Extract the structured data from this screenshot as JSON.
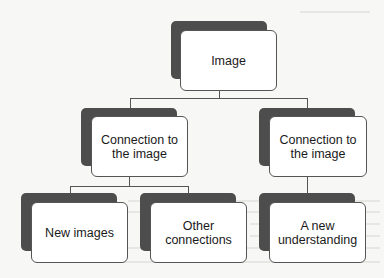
{
  "diagram": {
    "type": "hierarchy",
    "root": {
      "label": "Image"
    },
    "level2": [
      {
        "label": "Connection to the image",
        "line1": "Connection to",
        "line2": "the image"
      },
      {
        "label": "Connection to the image",
        "line1": "Connection to",
        "line2": "the image"
      }
    ],
    "level3": [
      {
        "label": "New images",
        "parent": 0
      },
      {
        "label": "Other connections",
        "line1": "Other",
        "line2": "connections",
        "parent": 0
      },
      {
        "label": "A new understanding",
        "line1": "A new",
        "line2": "understanding",
        "parent": 1
      }
    ],
    "colors": {
      "box_fill": "#ffffff",
      "box_border": "#555555",
      "shadow": "#4d4d4d",
      "connector": "#555555",
      "page": "#f7f7f5"
    }
  }
}
